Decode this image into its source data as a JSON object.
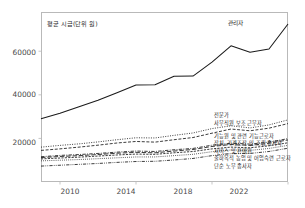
{
  "chart_data": {
    "type": "line",
    "title": "",
    "axis_note": "평균 시급(단위 원)",
    "xlabel": "",
    "ylabel": "",
    "xlim": [
      2009,
      2022
    ],
    "ylim": [
      0,
      78000
    ],
    "xticks": [
      2010,
      2014,
      2018,
      2022
    ],
    "yticks": [
      20000,
      40000,
      60000
    ],
    "ytick_labels": [
      "20000",
      "40000",
      "60000"
    ],
    "xtick_labels": [
      "2010",
      "2014",
      "2018",
      "2022"
    ],
    "grid": false,
    "legend_position": "right-inline-labels",
    "x": [
      2009,
      2010,
      2011,
      2012,
      2013,
      2014,
      2015,
      2016,
      2017,
      2018,
      2019,
      2020,
      2021,
      2022
    ],
    "series": [
      {
        "name": "관리자",
        "label": "관리자",
        "style": "solid",
        "values": [
          29000,
          31500,
          34500,
          37500,
          41000,
          44500,
          44600,
          48500,
          48600,
          55000,
          62500,
          59500,
          61000,
          72500
        ]
      },
      {
        "name": "전문가",
        "label": "전문가",
        "style": "dotted",
        "values": [
          16000,
          16800,
          17500,
          18400,
          19400,
          20300,
          20200,
          21400,
          22500,
          24500,
          25800,
          24800,
          26200,
          28500
        ]
      },
      {
        "name": "사무직원 보조 근무자",
        "label": "사무직원 보조 근무자",
        "style": "dashed",
        "values": [
          14500,
          15200,
          16000,
          16900,
          17900,
          18600,
          18300,
          19400,
          20400,
          22400,
          24300,
          23500,
          24700,
          26800
        ]
      },
      {
        "name": "기능원 및 관련 기능근로자",
        "label": "기능원 및 관련 기능근로자",
        "style": "dashdot",
        "values": [
          11600,
          12200,
          12600,
          13100,
          13700,
          14200,
          14000,
          14800,
          15400,
          16900,
          17800,
          17400,
          18300,
          19900
        ]
      },
      {
        "name": "장치, 기계조작 및 조립 종사자",
        "label": "장치, 기계조작 및 조립 종사자",
        "style": "longdash",
        "values": [
          11200,
          11700,
          12100,
          12600,
          13200,
          13600,
          13400,
          14200,
          14900,
          16300,
          17200,
          16800,
          17800,
          19300
        ]
      },
      {
        "name": "서비스 및 판매원",
        "label": "서비스 및 판매원",
        "style": "densedash",
        "values": [
          10600,
          11000,
          11400,
          11900,
          12400,
          12800,
          12700,
          13400,
          14000,
          15200,
          16000,
          15700,
          16600,
          18000
        ]
      },
      {
        "name": "출하목적 농업 및 어업숙련 근로자",
        "label": "출하목적 농업 및 어업숙련 근로자",
        "style": "finedot",
        "values": [
          9700,
          10000,
          10300,
          10700,
          11100,
          11500,
          11500,
          12100,
          12700,
          13900,
          14700,
          14500,
          15400,
          16800
        ]
      },
      {
        "name": "단순 노무 종사자",
        "label": "단순 노무 종사자",
        "style": "dashdotdot",
        "values": [
          7300,
          7700,
          8100,
          8500,
          9000,
          9400,
          9500,
          10100,
          10800,
          12100,
          13000,
          13100,
          14000,
          15500
        ]
      }
    ]
  },
  "labels": {
    "manager_inline": "관리자",
    "right_stack": [
      "전문가",
      "사무직원 보조 근무자",
      "기능원 및 관련 기능근로자",
      "장치, 기계조작 및 조립 종사자",
      "서비스 및 판매원",
      "출하목적 농업 및 어업숙련 근로자",
      "단순 노무 종사자"
    ]
  },
  "colors": {
    "line": "#1a1a1a",
    "frame": "#b9b9b9",
    "tick_text": "#4a4a4a",
    "background": "#ffffff"
  }
}
